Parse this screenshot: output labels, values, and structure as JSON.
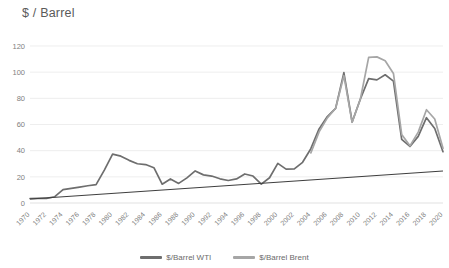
{
  "chart_data": {
    "type": "line",
    "title": "$ / Barrel",
    "xlabel": "",
    "ylabel": "$ / Barrel",
    "ylim": [
      0,
      120
    ],
    "xlim": [
      1970,
      2020
    ],
    "grid": true,
    "legend_position": "bottom",
    "yticks": [
      0,
      20,
      40,
      60,
      80,
      100,
      120
    ],
    "categories": [
      1970,
      1971,
      1972,
      1973,
      1974,
      1975,
      1976,
      1977,
      1978,
      1979,
      1980,
      1981,
      1982,
      1983,
      1984,
      1985,
      1986,
      1987,
      1988,
      1989,
      1990,
      1991,
      1992,
      1993,
      1994,
      1995,
      1996,
      1997,
      1998,
      1999,
      2000,
      2001,
      2002,
      2003,
      2004,
      2005,
      2006,
      2007,
      2008,
      2009,
      2010,
      2011,
      2012,
      2013,
      2014,
      2015,
      2016,
      2017,
      2018,
      2019,
      2020
    ],
    "xtick_labels": [
      "1970",
      "1972",
      "1974",
      "1976",
      "1978",
      "1980",
      "1982",
      "1984",
      "1986",
      "1988",
      "1990",
      "1992",
      "1994",
      "1996",
      "1998",
      "2000",
      "2002",
      "2004",
      "2006",
      "2008",
      "2010",
      "2012",
      "2014",
      "2016",
      "2018",
      "2020"
    ],
    "series": [
      {
        "name": "$/Barrel WTI",
        "color": "#6e6e6e",
        "values": [
          3.4,
          3.6,
          3.6,
          4.8,
          10.2,
          11.2,
          12.2,
          13.2,
          14.0,
          25.1,
          37.4,
          35.8,
          32.6,
          30.0,
          29.4,
          27.0,
          14.4,
          18.4,
          15.0,
          19.2,
          24.5,
          21.5,
          20.6,
          18.5,
          17.2,
          18.4,
          22.2,
          20.6,
          14.4,
          19.3,
          30.3,
          25.9,
          26.1,
          31.1,
          41.5,
          56.6,
          66.1,
          72.3,
          99.6,
          61.9,
          79.5,
          95.1,
          94.1,
          98.0,
          93.2,
          48.7,
          43.2,
          50.9,
          65.2,
          57.0,
          39.2
        ]
      },
      {
        "name": "$/Barrel Brent",
        "color": "#a6a6a6",
        "values": [
          null,
          null,
          null,
          null,
          null,
          null,
          null,
          null,
          null,
          null,
          null,
          null,
          null,
          null,
          null,
          null,
          null,
          null,
          null,
          null,
          null,
          null,
          null,
          null,
          null,
          null,
          null,
          null,
          null,
          null,
          null,
          null,
          null,
          null,
          38.3,
          54.4,
          65.1,
          72.4,
          97.3,
          61.7,
          79.5,
          111.3,
          111.7,
          108.7,
          99.0,
          52.4,
          43.7,
          54.2,
          71.3,
          64.2,
          41.8
        ]
      }
    ],
    "trendline": {
      "name": "linear-trend",
      "color": "#3f3f3f",
      "start": 3.0,
      "end": 24.5
    },
    "legend": [
      {
        "label": "$/Barrel WTI",
        "color": "#6e6e6e"
      },
      {
        "label": "$/Barrel Brent",
        "color": "#a6a6a6"
      }
    ]
  }
}
